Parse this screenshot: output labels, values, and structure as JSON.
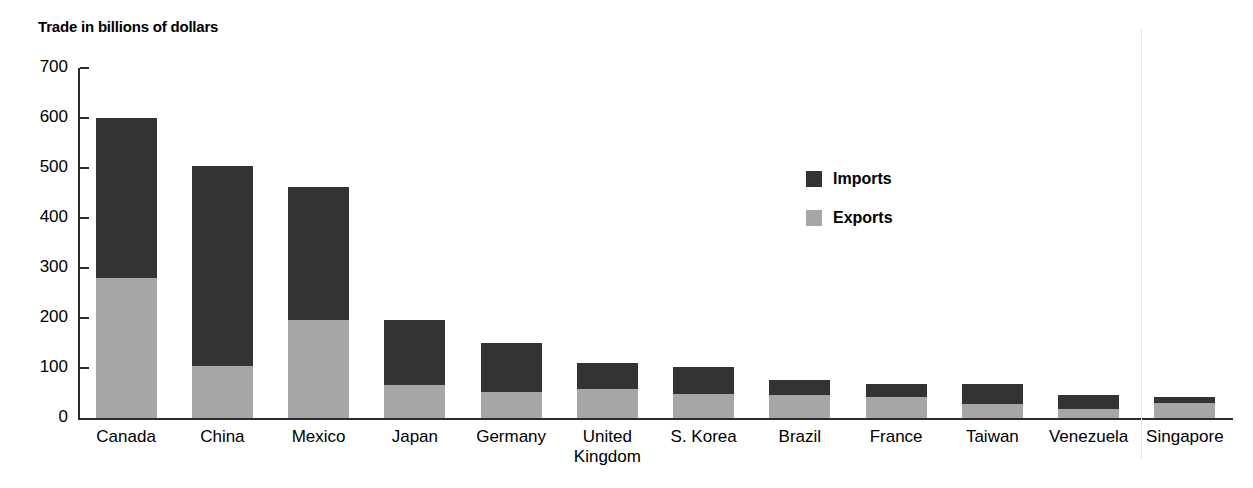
{
  "chart_data": {
    "type": "bar",
    "subtype": "stacked-vertical",
    "title": "Trade in billions of dollars",
    "xlabel": "",
    "ylabel": "",
    "ylim": [
      0,
      700
    ],
    "yticks": [
      0,
      100,
      200,
      300,
      400,
      500,
      600,
      700
    ],
    "ytick_labels": [
      "0",
      "100",
      "200",
      "300",
      "400",
      "500",
      "600",
      "700"
    ],
    "grid": false,
    "legend_position": "inside-upper-right",
    "categories": [
      "Canada",
      "China",
      "Mexico",
      "Japan",
      "Germany",
      "United\nKingdom",
      "S. Korea",
      "Brazil",
      "France",
      "Taiwan",
      "Venezuela",
      "Singapore"
    ],
    "series": [
      {
        "name": "Exports",
        "color": "#a6a6a6",
        "values": [
          280,
          104,
          196,
          66,
          52,
          58,
          48,
          46,
          42,
          28,
          18,
          30
        ]
      },
      {
        "name": "Imports",
        "color": "#333333",
        "values": [
          320,
          400,
          266,
          130,
          98,
          52,
          54,
          30,
          26,
          40,
          28,
          12
        ]
      }
    ],
    "totals": [
      600,
      504,
      462,
      196,
      150,
      110,
      102,
      76,
      68,
      68,
      46,
      42
    ]
  },
  "legend": {
    "items": [
      {
        "label": "Imports",
        "color": "#333333"
      },
      {
        "label": "Exports",
        "color": "#a6a6a6"
      }
    ]
  },
  "colors": {
    "imports": "#333333",
    "exports": "#a6a6a6",
    "axis": "#2b2b2b",
    "background": "#ffffff"
  }
}
